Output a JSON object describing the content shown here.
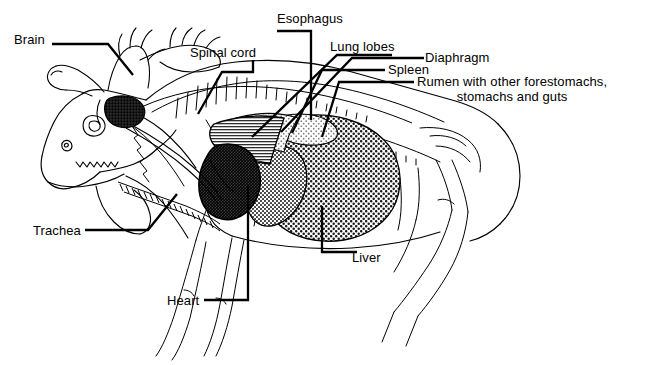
{
  "figure": {
    "view": "lateral",
    "style": "black and white line drawing with hatched organ shading",
    "background_color": "#ffffff",
    "line_color": "#000000",
    "width": 656,
    "height": 365
  },
  "labels": [
    {
      "id": "brain",
      "text": "Brain",
      "x": 14,
      "y": 32,
      "align": "left",
      "leader": "horizontal then diagonal down-right into skull"
    },
    {
      "id": "spinal-cord",
      "text": "Spinal cord",
      "x": 190,
      "y": 45,
      "align": "left",
      "leader": "bracket then diagonal down-left to neck vertebrae"
    },
    {
      "id": "esophagus",
      "text": "Esophagus",
      "x": 277,
      "y": 11,
      "align": "left",
      "leader": "horizontal then vertical down to thorax"
    },
    {
      "id": "lung-lobes",
      "text": "Lung lobes",
      "x": 330,
      "y": 39,
      "align": "left",
      "leader": "bracket then steep diagonal down-left to lung"
    },
    {
      "id": "diaphragm",
      "text": "Diaphragm",
      "x": 425,
      "y": 50,
      "align": "left",
      "leader": "horizontal then steep diagonal down-left to diaphragm"
    },
    {
      "id": "spleen",
      "text": "Spleen",
      "x": 388,
      "y": 62,
      "align": "left",
      "leader": "bracket then steep diagonal down-left to spleen"
    },
    {
      "id": "rumen",
      "text": "Rumen with other forestomachs,\nstomachs and guts",
      "x": 417,
      "y": 74,
      "align": "left",
      "leader": "horizontal then steep diagonal down-left to rumen"
    },
    {
      "id": "trachea",
      "text": "Trachea",
      "x": 33,
      "y": 223,
      "align": "left",
      "leader": "horizontal then diagonal up-right to trachea tube"
    },
    {
      "id": "heart",
      "text": "Heart",
      "x": 167,
      "y": 293,
      "align": "left",
      "leader": "horizontal then vertical up to heart"
    },
    {
      "id": "liver",
      "text": "Liver",
      "x": 352,
      "y": 250,
      "align": "left",
      "leader": "vertical up then horizontal left to liver"
    }
  ],
  "organs": [
    {
      "id": "brain",
      "shading": "dense stipple",
      "region": "skull"
    },
    {
      "id": "spinal-cord",
      "shading": "line",
      "region": "neck and back"
    },
    {
      "id": "esophagus",
      "shading": "line",
      "region": "neck to thorax"
    },
    {
      "id": "trachea",
      "shading": "ribbed tube",
      "region": "throat to chest"
    },
    {
      "id": "heart",
      "shading": "dense dark stipple",
      "region": "chest"
    },
    {
      "id": "lung-lobes",
      "shading": "fine horizontal hatch",
      "region": "thorax"
    },
    {
      "id": "diaphragm",
      "shading": "light stipple band",
      "region": "behind lungs"
    },
    {
      "id": "spleen",
      "shading": "medium stipple",
      "region": "upper abdomen"
    },
    {
      "id": "liver",
      "shading": "medium stipple",
      "region": "mid abdomen"
    },
    {
      "id": "rumen",
      "shading": "coarse mesh stipple",
      "region": "abdomen"
    }
  ],
  "colors": {
    "ink": "#000000",
    "paper": "#ffffff",
    "shade_dark": "#2a2a2a",
    "shade_mid": "#6e6e6e",
    "shade_light": "#b5b5b5"
  }
}
